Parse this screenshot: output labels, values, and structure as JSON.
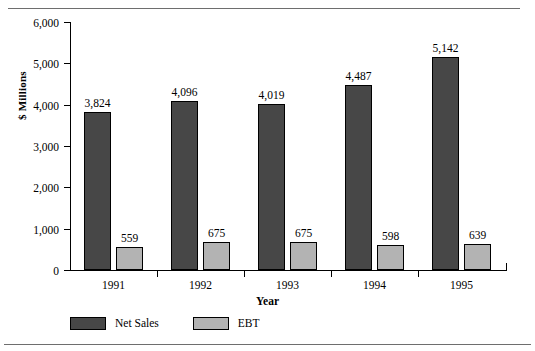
{
  "chart_data": {
    "type": "bar",
    "title": "",
    "subtitle": "",
    "xlabel": "Year",
    "ylabel": "$ Millions",
    "categories": [
      "1991",
      "1992",
      "1993",
      "1994",
      "1995"
    ],
    "series": [
      {
        "name": "Net Sales",
        "color": "#474747",
        "values": [
          3824,
          4096,
          4019,
          4487,
          5142
        ],
        "value_labels": [
          "3,824",
          "4,096",
          "4,019",
          "4,487",
          "5,142"
        ]
      },
      {
        "name": "EBT",
        "color": "#b3b3b3",
        "values": [
          559,
          675,
          675,
          598,
          639
        ],
        "value_labels": [
          "559",
          "675",
          "675",
          "598",
          "639"
        ]
      }
    ],
    "ylim": [
      0,
      6000
    ],
    "ytick_values": [
      0,
      1000,
      2000,
      3000,
      4000,
      5000,
      6000
    ],
    "ytick_labels": [
      "0",
      "1,000",
      "2,000",
      "3,000",
      "4,000",
      "5,000",
      "6,000"
    ],
    "grid": false,
    "legend_position": "bottom-left",
    "data_labels_shown": true
  },
  "legend": {
    "items": [
      {
        "label": "Net Sales",
        "color": "#474747"
      },
      {
        "label": "EBT",
        "color": "#b3b3b3"
      }
    ]
  },
  "colors": {
    "net_sales": "#474747",
    "ebt": "#b3b3b3",
    "axis": "#000000",
    "rule": "#6e6e6e",
    "background": "#ffffff"
  }
}
